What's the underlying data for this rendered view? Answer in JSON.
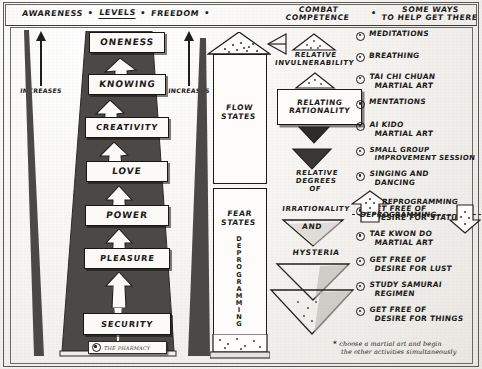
{
  "header": {
    "items": [
      {
        "label": "AWARENESS",
        "underlined": false
      },
      {
        "label": "LEVELS",
        "underlined": true
      },
      {
        "label": "FREEDOM",
        "underlined": false
      }
    ],
    "separator": "•",
    "col3": {
      "line1": "COMBAT",
      "line2": "COMPETENCE"
    },
    "col4": {
      "line1": "SOME WAYS",
      "line2": "TO HELP GET THERE"
    }
  },
  "axis": {
    "left_label": "INCREASES",
    "right_label": "INCREASES",
    "arrow_direction": "up"
  },
  "levels": [
    {
      "label": "ONENESS"
    },
    {
      "label": "KNOWING"
    },
    {
      "label": "CREATIVITY"
    },
    {
      "label": "LOVE"
    },
    {
      "label": "POWER"
    },
    {
      "label": "PLEASURE"
    },
    {
      "label": "SECURITY"
    }
  ],
  "stamp": {
    "signature": "THE PHARMACY"
  },
  "states_column": {
    "flow": {
      "line1": "FLOW",
      "line2": "STATES"
    },
    "fear": {
      "line1": "FEAR",
      "line2": "STATES"
    },
    "vertical_label": "DEPROGRAMMING"
  },
  "combat": {
    "top_label": {
      "line1": "RELATIVE",
      "line2": "INVULNERABILITY"
    },
    "box": {
      "line1": "RELATING",
      "line2": "RATIONALITY"
    },
    "mid_label": {
      "line1": "RELATIVE",
      "line2": "DEGREES",
      "line3": "OF",
      "line4": "IRRATIONALITY"
    },
    "and_label": "AND",
    "bottom_label": "HYSTERIA"
  },
  "practices": [
    {
      "line1": "MEDITATIONS",
      "line2": ""
    },
    {
      "line1": "BREATHING",
      "line2": ""
    },
    {
      "line1": "TAI CHI CHUAN",
      "line2": "MARTIAL ART"
    },
    {
      "line1": "MENTATIONS",
      "line2": ""
    },
    {
      "line1": "AI KIDO",
      "line2": "MARTIAL ART"
    },
    {
      "line1": "SMALL GROUP",
      "line2": "IMPROVEMENT SESSION"
    },
    {
      "line1": "SINGING AND",
      "line2": "DANCING"
    },
    {
      "line1": "GET FREE OF",
      "line2": "DESIRE FOR STATUS"
    },
    {
      "line1": "TAE KWON DO",
      "line2": "MARTIAL ART"
    },
    {
      "line1": "GET FREE OF",
      "line2": "DESIRE FOR LUST"
    },
    {
      "line1": "STUDY SAMURAI",
      "line2": "REGIMEN"
    },
    {
      "line1": "GET FREE OF",
      "line2": "DESIRE FOR THINGS"
    }
  ],
  "programming": {
    "up_label": "REPROGRAMMING",
    "down_label": "DEPROGRAMMING"
  },
  "footnote": {
    "marker": "*",
    "line1": "choose a martial art and begin",
    "line2": "the other activities simultaneously"
  },
  "colors": {
    "ink": "#1c1b19",
    "wedge": "#4a4845",
    "paper": "#f6f5f2"
  }
}
